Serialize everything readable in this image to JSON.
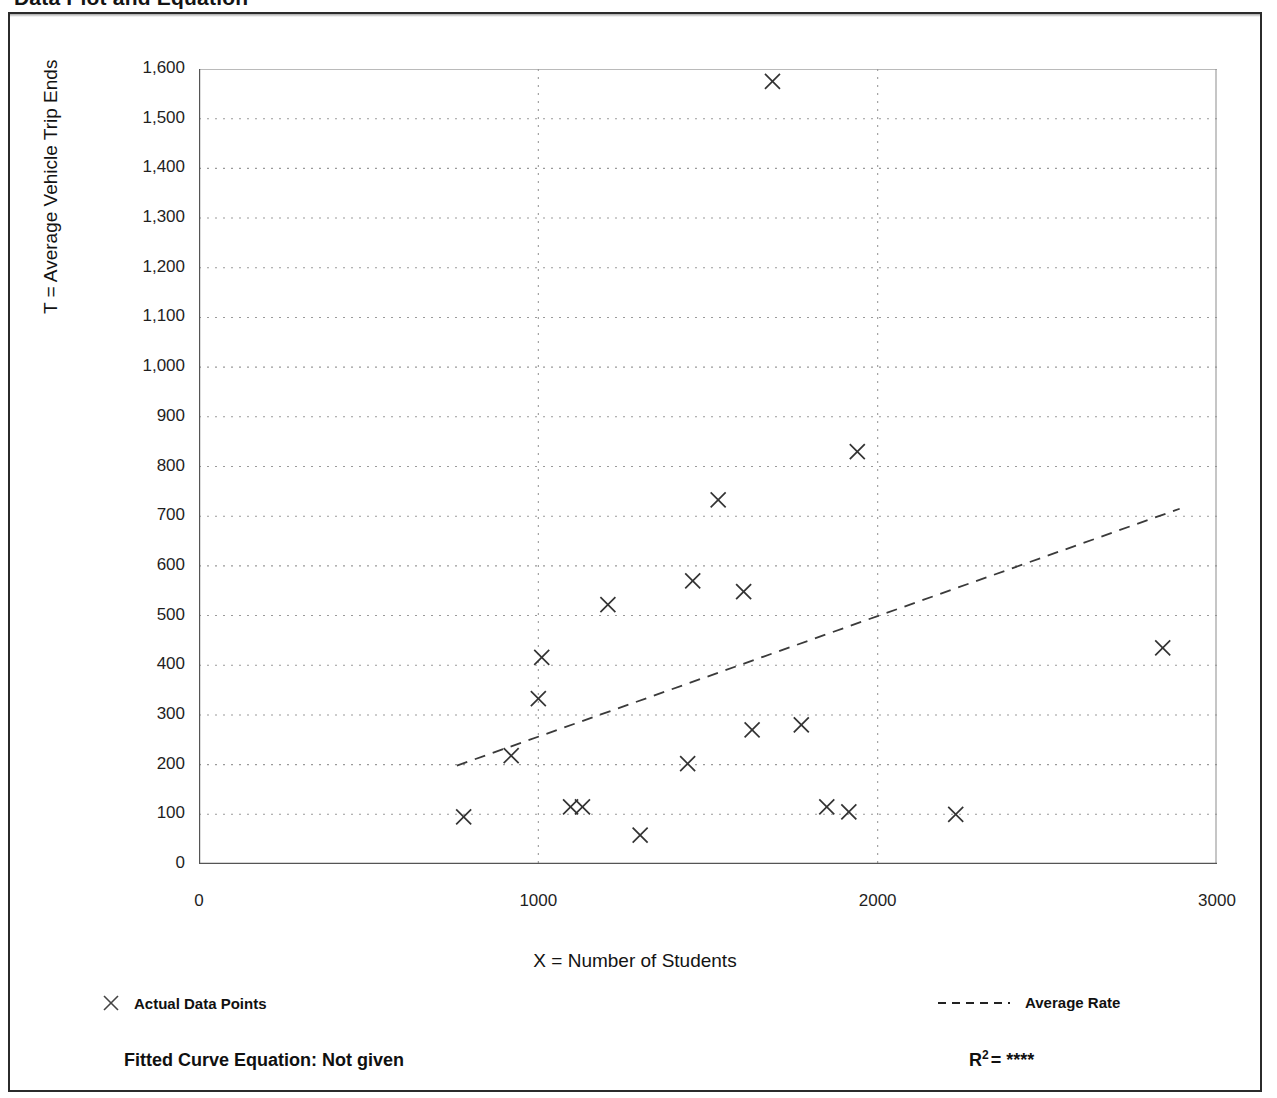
{
  "page": {
    "title": "Data Plot and Equation"
  },
  "axes": {
    "y_title": "T = Average Vehicle Trip Ends",
    "x_title": "X = Number of Students",
    "y_ticks": [
      "1,600",
      "1,500",
      "1,400",
      "1,300",
      "1,200",
      "1,100",
      "1,000",
      "900",
      "800",
      "700",
      "600",
      "500",
      "400",
      "300",
      "200",
      "100",
      "0"
    ],
    "x_ticks": [
      "0",
      "1000",
      "2000",
      "3000"
    ]
  },
  "legend": {
    "points_label": "Actual Data Points",
    "points_marker": "x-marker-icon",
    "rate_label": "Average Rate",
    "rate_marker": "dashed-line-icon"
  },
  "footer": {
    "equation_label": "Fitted Curve Equation:  Not given",
    "r_symbol": "R",
    "r_exponent": "2",
    "r_equals": "=",
    "r_value": "****"
  },
  "colors": {
    "frame": "#2b2b2b",
    "axis": "#555555",
    "grid": "#9a9a9a",
    "marker": "#333333",
    "trend": "#3a3a3a"
  },
  "chart_data": {
    "type": "scatter",
    "title": "Data Plot and Equation",
    "xlabel": "X = Number of Students",
    "ylabel": "T = Average Vehicle Trip Ends",
    "xlim": [
      0,
      3000
    ],
    "ylim": [
      0,
      1600
    ],
    "x_major_ticks": [
      0,
      1000,
      2000,
      3000
    ],
    "x_minor_ticks": [
      500,
      1500,
      2500
    ],
    "y_major_ticks": [
      0,
      100,
      200,
      300,
      400,
      500,
      600,
      700,
      800,
      900,
      1000,
      1100,
      1200,
      1300,
      1400,
      1500,
      1600
    ],
    "y_minor_ticks": [
      50,
      150,
      250,
      350,
      450,
      550,
      650,
      750,
      850,
      950,
      1050,
      1150,
      1250,
      1350,
      1450,
      1550
    ],
    "grid": true,
    "legend_position": "below-axes",
    "series": [
      {
        "name": "Actual Data Points",
        "type": "scatter",
        "marker": "x",
        "points": [
          {
            "x": 780,
            "y": 95
          },
          {
            "x": 920,
            "y": 218
          },
          {
            "x": 1000,
            "y": 333
          },
          {
            "x": 1010,
            "y": 416
          },
          {
            "x": 1095,
            "y": 115
          },
          {
            "x": 1130,
            "y": 115
          },
          {
            "x": 1205,
            "y": 522
          },
          {
            "x": 1300,
            "y": 58
          },
          {
            "x": 1440,
            "y": 202
          },
          {
            "x": 1455,
            "y": 570
          },
          {
            "x": 1530,
            "y": 733
          },
          {
            "x": 1605,
            "y": 548
          },
          {
            "x": 1630,
            "y": 270
          },
          {
            "x": 1690,
            "y": 1575
          },
          {
            "x": 1775,
            "y": 280
          },
          {
            "x": 1850,
            "y": 115
          },
          {
            "x": 1915,
            "y": 105
          },
          {
            "x": 1940,
            "y": 830
          },
          {
            "x": 2230,
            "y": 100
          },
          {
            "x": 2840,
            "y": 435
          }
        ]
      },
      {
        "name": "Average Rate",
        "type": "line",
        "style": "dashed",
        "points": [
          {
            "x": 760,
            "y": 198
          },
          {
            "x": 2890,
            "y": 715
          }
        ]
      }
    ]
  }
}
